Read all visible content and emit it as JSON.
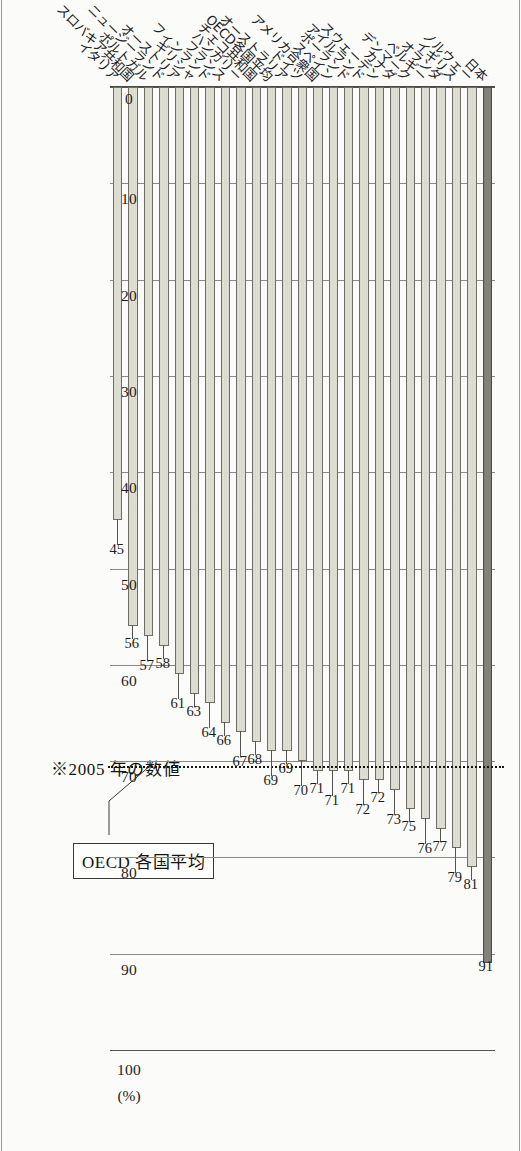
{
  "figure": {
    "note": "※2005 年の数値",
    "average_label": "OECD 各国平均",
    "unit_label": "(%)"
  },
  "chart_data": {
    "type": "bar",
    "orientation": "horizontal-rotated",
    "title": "",
    "xlabel": "(%)",
    "ylabel": "",
    "xlim": [
      0,
      100
    ],
    "xticks": [
      0,
      10,
      20,
      30,
      40,
      50,
      60,
      70,
      80,
      90,
      100
    ],
    "xticklabels": [
      "0",
      "10",
      "20",
      "30",
      "40",
      "50",
      "60",
      "70",
      "80",
      "90",
      "100"
    ],
    "grid": true,
    "grid_axis": "x",
    "legend": "none",
    "reference_line": {
      "label": "OECD 各国平均",
      "value": 70.5,
      "style": "dotted"
    },
    "highlight": {
      "category": "日本",
      "color": "#84847c"
    },
    "bar_color": "#e0e0d4",
    "categories": [
      "日本",
      "ノルウェー",
      "イギリス",
      "オランダ",
      "ベルギー",
      "デンマーク",
      "カナダ",
      "スウェーデン",
      "アイルランド",
      "ポーランド",
      "スペイン",
      "アメリカ合衆国",
      "ドイツ",
      "オーストラリア",
      "OECD各国平均",
      "チェコ共和国",
      "ハンガリー",
      "フランス",
      "フィンランド",
      "ギリシャ",
      "オーストリア",
      "ニュージーランド",
      "ポルトガル",
      "スロバキア共和国",
      "イタリア"
    ],
    "values": [
      91,
      81,
      79,
      77,
      76,
      75,
      73,
      72,
      72,
      71,
      71,
      71,
      70,
      69,
      69,
      68,
      67,
      66,
      64,
      63,
      61,
      58,
      57,
      56,
      45
    ],
    "value_labels": [
      "91",
      "81",
      "79",
      "77",
      "76",
      "75",
      "73",
      "72",
      "72",
      "71",
      "71",
      "71",
      "70",
      "69",
      "69",
      "68",
      "67",
      "66",
      "64",
      "63",
      "61",
      "58",
      "57",
      "56",
      "45"
    ]
  }
}
